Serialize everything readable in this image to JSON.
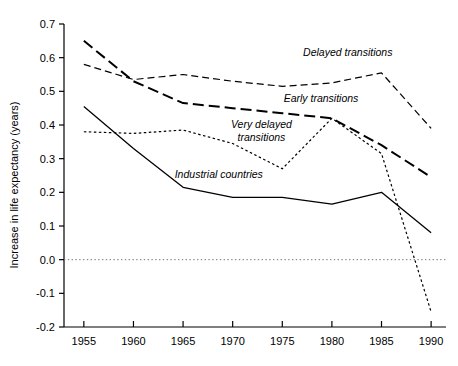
{
  "chart_data": {
    "type": "line",
    "title": "",
    "xlabel": "",
    "ylabel": "Increase in life expectancy (years)",
    "x": [
      1955,
      1960,
      1965,
      1970,
      1975,
      1980,
      1985,
      1990
    ],
    "xlim": [
      1953,
      1991.5
    ],
    "ylim": [
      -0.2,
      0.7
    ],
    "xticks": [
      "1955",
      "1960",
      "1965",
      "1970",
      "1975",
      "1980",
      "1985",
      "1990"
    ],
    "yticks": [
      "-0.2",
      "-0.1",
      "0.0",
      "0.1",
      "0.2",
      "0.3",
      "0.4",
      "0.5",
      "0.6",
      "0.7"
    ],
    "grid": false,
    "legend_position": "inline-annotations",
    "zero_line": 0.0,
    "series": [
      {
        "name": "Early transitions",
        "style": "long-dash",
        "values": [
          0.65,
          0.53,
          0.465,
          0.45,
          0.435,
          0.42,
          0.34,
          0.245
        ]
      },
      {
        "name": "Delayed transitions",
        "style": "medium-dash",
        "values": [
          0.58,
          0.535,
          0.55,
          0.53,
          0.515,
          0.525,
          0.555,
          0.39
        ]
      },
      {
        "name": "Very delayed transitions",
        "style": "dotted",
        "values": [
          0.38,
          0.375,
          0.385,
          0.345,
          0.27,
          0.42,
          0.315,
          -0.155
        ]
      },
      {
        "name": "Industrial countries",
        "style": "solid",
        "values": [
          0.455,
          0.33,
          0.215,
          0.185,
          0.185,
          0.165,
          0.2,
          0.08
        ]
      }
    ],
    "annotations": [
      {
        "text": "Delayed transitions",
        "x": 1981.6,
        "y": 0.605
      },
      {
        "text": "Early transitions",
        "x": 1978.9,
        "y": 0.468
      },
      {
        "text": "Very delayed",
        "x": 1972.9,
        "y": 0.392
      },
      {
        "text": "transitions",
        "x": 1972.9,
        "y": 0.353
      },
      {
        "text": "Industrial countries",
        "x": 1968.6,
        "y": 0.243
      }
    ],
    "colors": {
      "axis": "#000000",
      "line": "#000000",
      "zero_line": "#666666",
      "background": "#ffffff"
    }
  }
}
